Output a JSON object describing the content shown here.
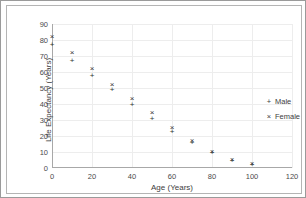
{
  "chart_data": {
    "type": "scatter",
    "title": "",
    "xlabel": "Age (Years)",
    "ylabel": "Life Expectancy (Years)",
    "xlim": [
      0,
      120
    ],
    "ylim": [
      0,
      90
    ],
    "xticks": [
      0,
      20,
      40,
      60,
      80,
      100,
      120
    ],
    "yticks": [
      0,
      10,
      20,
      30,
      40,
      50,
      60,
      70,
      80,
      90
    ],
    "grid": true,
    "legend_position": "right",
    "x": [
      0,
      10,
      20,
      30,
      40,
      50,
      60,
      70,
      80,
      90,
      100
    ],
    "series": [
      {
        "name": "Male",
        "marker": "+",
        "values": [
          76,
          66.5,
          57,
          48,
          38.5,
          30,
          22,
          15,
          8.5,
          4,
          1.5
        ]
      },
      {
        "name": "Female",
        "marker": "×",
        "values": [
          81,
          71.5,
          61.5,
          51.5,
          42.5,
          33.5,
          24.5,
          16,
          9.5,
          4.5,
          2
        ]
      }
    ]
  },
  "legend": {
    "entries": [
      {
        "marker": "+",
        "label": "Male"
      },
      {
        "marker": "×",
        "label": "Female"
      }
    ]
  },
  "colors": {
    "marker": "#333333",
    "axis": "#a8a8a8",
    "grid": "#ededed",
    "text": "#3d3d3d",
    "border": "#9a9a9a",
    "background": "#ffffff"
  }
}
